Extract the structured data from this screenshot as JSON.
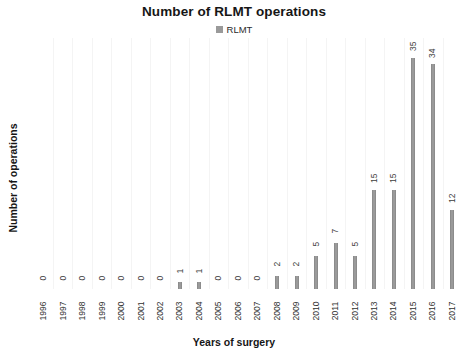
{
  "chart_data": {
    "type": "bar",
    "title": "Number of RLMT operations",
    "xlabel": "Years of surgery",
    "ylabel": "Number of operations",
    "legend": [
      {
        "name": "RLMT",
        "color": "#9a9a9a"
      }
    ],
    "legend_position": "top-center",
    "grid": "vertical-faint",
    "ylim": [
      0,
      38
    ],
    "bar_color": "#9a9a9a",
    "show_value_labels": true,
    "value_label_rotation": -90,
    "tick_label_rotation": -90,
    "categories": [
      "1996",
      "1997",
      "1998",
      "1999",
      "2000",
      "2001",
      "2002",
      "2003",
      "2004",
      "2005",
      "2006",
      "2007",
      "2008",
      "2009",
      "2010",
      "2011",
      "2012",
      "2013",
      "2014",
      "2015",
      "2016",
      "2017"
    ],
    "series": [
      {
        "name": "RLMT",
        "values": [
          0,
          0,
          0,
          0,
          0,
          0,
          0,
          1,
          1,
          0,
          0,
          0,
          2,
          2,
          5,
          7,
          5,
          15,
          15,
          35,
          34,
          12
        ]
      }
    ]
  }
}
